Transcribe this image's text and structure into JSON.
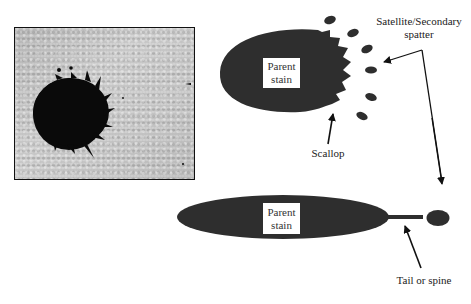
{
  "figure": {
    "photo": {
      "description": "Photograph of a dark blood stain with scalloped edges on a textured surface"
    },
    "top_diagram": {
      "stain_label": [
        "Parent",
        "stain"
      ],
      "scallop_label": "Scallop",
      "satellite_label": [
        "Satellite/Secondary",
        "spatter"
      ],
      "satellite_count": 6
    },
    "bottom_diagram": {
      "stain_label": [
        "Parent",
        "stain"
      ],
      "tail_label": "Tail or spine"
    },
    "colors": {
      "stain": "#2e2e2e",
      "arrow": "#111111",
      "label_box": "#ffffff",
      "background": "#ffffff"
    }
  }
}
